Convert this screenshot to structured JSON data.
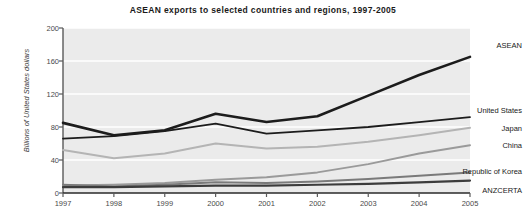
{
  "chart_data": {
    "type": "line",
    "title": "ASEAN exports to selected countries and regions, 1997-2005",
    "xlabel": "",
    "ylabel": "Billions of United States dollars",
    "categories": [
      "1997",
      "1998",
      "1999",
      "2000",
      "2001",
      "2002",
      "2003",
      "2004",
      "2005"
    ],
    "x": [
      1997,
      1998,
      1999,
      2000,
      2001,
      2002,
      2003,
      2004,
      2005
    ],
    "ylim": [
      0,
      200
    ],
    "yticks": [
      0,
      40,
      80,
      120,
      160,
      200
    ],
    "grid": "horizontal",
    "legend_position": "right-inline-labels",
    "plot_background": "#ebebeb",
    "series": [
      {
        "name": "ASEAN",
        "color": "#1c1c1c",
        "width": 2.6,
        "values": [
          85,
          70,
          76,
          96,
          86,
          93,
          118,
          143,
          165
        ]
      },
      {
        "name": "United States",
        "color": "#1c1c1c",
        "width": 1.8,
        "values": [
          66,
          69,
          75,
          84,
          72,
          76,
          80,
          86,
          92
        ]
      },
      {
        "name": "Japan",
        "color": "#b4b4b4",
        "width": 2.0,
        "values": [
          52,
          42,
          48,
          60,
          54,
          56,
          62,
          70,
          79
        ]
      },
      {
        "name": "China",
        "color": "#9a9a9a",
        "width": 2.0,
        "values": [
          9,
          10,
          12,
          16,
          19,
          25,
          35,
          48,
          58
        ]
      },
      {
        "name": "Republic of Korea",
        "color": "#7a7a7a",
        "width": 2.0,
        "values": [
          10,
          8,
          10,
          13,
          12,
          14,
          17,
          21,
          25
        ]
      },
      {
        "name": "ANZCERTA",
        "color": "#3c3c3c",
        "width": 2.2,
        "values": [
          7,
          7,
          8,
          9,
          9,
          10,
          11,
          13,
          15
        ]
      }
    ]
  },
  "labels": {
    "asean": "ASEAN",
    "united_states": "United States",
    "japan": "Japan",
    "china": "China",
    "republic_of_korea": "Republic of Korea",
    "anzcerta": "ANZCERTA"
  }
}
